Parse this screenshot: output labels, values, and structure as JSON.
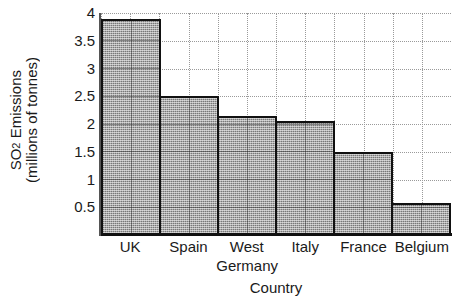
{
  "chart_data": {
    "type": "bar",
    "title": "",
    "categories": [
      "UK",
      "Spain",
      "West Germany",
      "Italy",
      "France",
      "Belgium"
    ],
    "category_label_lines": [
      [
        "UK"
      ],
      [
        "Spain"
      ],
      [
        "West",
        "Germany"
      ],
      [
        "Italy"
      ],
      [
        "France"
      ],
      [
        "Belgium"
      ]
    ],
    "values": [
      3.9,
      2.5,
      2.15,
      2.05,
      1.5,
      0.57
    ],
    "xlabel": "Country",
    "ylabel_lines": [
      "SO2 Emissions",
      "(millions of tonnes)"
    ],
    "ylabel_main": "SO",
    "ylabel_sub": "2",
    "ylabel_main_rest": " Emissions",
    "ylabel_second": "(millions of tonnes)",
    "ylim": [
      0,
      4
    ],
    "ytick_values": [
      4,
      3.5,
      3,
      2.5,
      2,
      1.5,
      1,
      0.5
    ],
    "ytick_labels": [
      "4",
      "3.5",
      "3",
      "2.5",
      "2",
      "1.5",
      "1",
      "0.5"
    ],
    "grid": true,
    "grid_axes": "both",
    "legend": false,
    "legend_position": "none",
    "bar_fill_color": "#a9a9a9",
    "bar_fill_pattern": "stipple-gray-50",
    "bar_edge_color": "#111111",
    "grid_color": "#9a9a9a",
    "background_color": "#ffffff",
    "text_color": "#1a1a1a",
    "bar_gap": 0
  },
  "icons": {
    "none": "none"
  }
}
